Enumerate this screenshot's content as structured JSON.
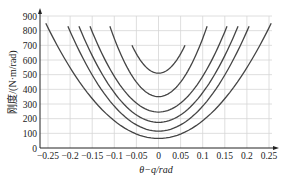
{
  "chart_data": {
    "type": "line",
    "title": "",
    "xlabel": "θ−q/rad",
    "ylabel": "刚度/(N·m/rad)",
    "xlim": [
      -0.27,
      0.27
    ],
    "ylim": [
      0,
      900
    ],
    "grid": true,
    "legend": null,
    "x_ticks": [
      -0.25,
      -0.2,
      -0.15,
      -0.1,
      -0.05,
      0,
      0.05,
      0.1,
      0.15,
      0.2,
      0.25
    ],
    "x_tick_labels": [
      "−0.25",
      "−0.2",
      "−0.15",
      "−0.1",
      "−0.05",
      "0",
      "0.05",
      "0.1",
      "0.15",
      "0.2",
      "0.25"
    ],
    "y_ticks": [
      0,
      100,
      200,
      300,
      400,
      500,
      600,
      700,
      800,
      900
    ],
    "y_tick_labels": [
      "0",
      "100",
      "200",
      "300",
      "400",
      "500",
      "600",
      "700",
      "800",
      "900"
    ],
    "series": [
      {
        "name": "curve-1",
        "min": 510,
        "x_range": [
          -0.06,
          0.06
        ],
        "y_end": 700
      },
      {
        "name": "curve-2",
        "min": 350,
        "x_range": [
          -0.11,
          0.11
        ],
        "y_end": 830
      },
      {
        "name": "curve-3",
        "min": 245,
        "x_range": [
          -0.155,
          0.155
        ],
        "y_end": 830
      },
      {
        "name": "curve-4",
        "min": 175,
        "x_range": [
          -0.18,
          0.18
        ],
        "y_end": 830
      },
      {
        "name": "curve-5",
        "min": 115,
        "x_range": [
          -0.205,
          0.205
        ],
        "y_end": 830
      },
      {
        "name": "curve-6",
        "min": 65,
        "x_range": [
          -0.255,
          0.255
        ],
        "y_end": 850
      }
    ]
  }
}
